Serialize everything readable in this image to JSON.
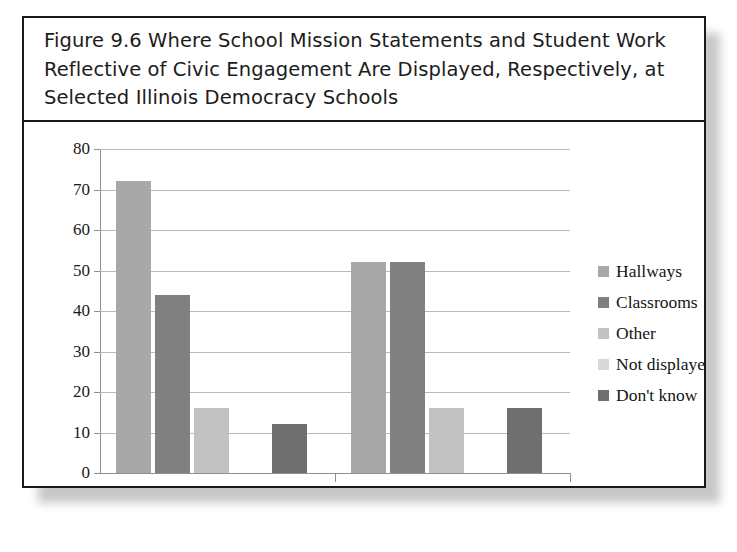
{
  "figure": {
    "title": "Figure 9.6 Where School Mission Statements and Student Work Reflective of Civic Engagement Are Displayed, Respectively, at Selected Illinois Democracy Schools"
  },
  "chart_data": {
    "type": "bar",
    "title": "Figure 9.6 Where School Mission Statements and Student Work Reflective of Civic Engagement Are Displayed, Respectively, at Selected Illinois Democracy Schools",
    "xlabel": "",
    "ylabel": "",
    "categories": [
      "Mission statement",
      "Student work"
    ],
    "series": [
      {
        "name": "Hallways",
        "values": [
          72,
          52
        ],
        "color": "#a8a8a8"
      },
      {
        "name": "Classrooms",
        "values": [
          44,
          52
        ],
        "color": "#808080"
      },
      {
        "name": "Other",
        "values": [
          16,
          16
        ],
        "color": "#c2c2c2"
      },
      {
        "name": "Not displayed",
        "values": [
          0,
          0
        ],
        "color": "#d8d8d8"
      },
      {
        "name": "Don't know",
        "values": [
          12,
          16
        ],
        "color": "#6f6f6f"
      }
    ],
    "ylim": [
      0,
      80
    ],
    "yticks": [
      0,
      10,
      20,
      30,
      40,
      50,
      60,
      70,
      80
    ],
    "ytick_labels": [
      "0",
      "10",
      "20",
      "30",
      "40",
      "50",
      "60",
      "70",
      "80"
    ],
    "grid": true,
    "legend_position": "right",
    "orientation": "vertical"
  }
}
